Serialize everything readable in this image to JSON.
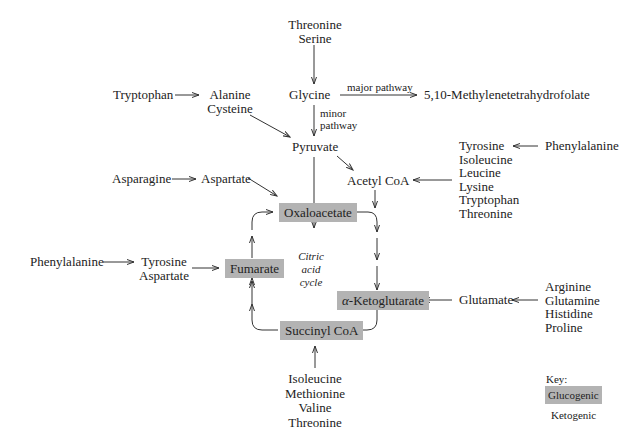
{
  "diagram": {
    "top": {
      "threonine_serine": [
        "Threonine",
        "Serine"
      ],
      "glycine": "Glycine",
      "major_pathway_label": "major pathway",
      "minor_pathway_label": [
        "minor",
        "pathway"
      ],
      "methylene_thf": "5,10-Methylenetetrahydrofolate",
      "tryptophan": "Tryptophan",
      "alanine_cysteine": [
        "Alanine",
        "Cysteine"
      ],
      "pyruvate": "Pyruvate",
      "acetyl_coa": "Acetyl CoA"
    },
    "right_upper": {
      "ketogenic_sources": [
        "Tyrosine",
        "Isoleucine",
        "Leucine",
        "Lysine",
        "Tryptophan",
        "Threonine"
      ],
      "phenylalanine": "Phenylalanine"
    },
    "left": {
      "asparagine": "Asparagine",
      "aspartate": "Aspartate",
      "phenylalanine": "Phenylalanine",
      "tyrosine_aspartate": [
        "Tyrosine",
        "Aspartate"
      ]
    },
    "cycle": {
      "oxaloacetate": "Oxaloacetate",
      "fumarate": "Fumarate",
      "alpha_ketoglutarate_symbol": "α",
      "alpha_ketoglutarate": "-Ketoglutarate",
      "succinyl_coa": "Succinyl CoA",
      "center_label": [
        "Citric",
        "acid",
        "cycle"
      ]
    },
    "right_lower": {
      "glutamate": "Glutamate",
      "glutamate_sources": [
        "Arginine",
        "Glutamine",
        "Histidine",
        "Proline"
      ]
    },
    "bottom": {
      "succinyl_sources": [
        "Isoleucine",
        "Methionine",
        "Valine",
        "Threonine"
      ]
    },
    "key": {
      "title": "Key:",
      "glucogenic": "Glucogenic",
      "ketogenic": "Ketogenic",
      "glucogenic_color": "#b3b3b3",
      "ketogenic_color": "#ffffff"
    }
  }
}
